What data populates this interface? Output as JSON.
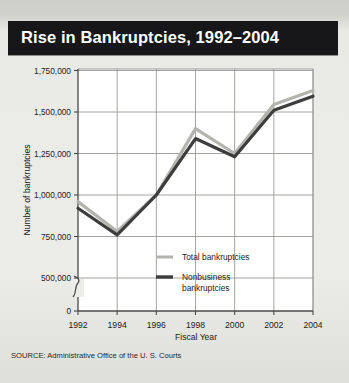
{
  "title": "Rise in Bankruptcies, 1992–2004",
  "source": "SOURCE: Administrative Office of the U. S. Courts",
  "colors": {
    "title_bar": "#17171a",
    "title_text": "#ffffff",
    "page_background": "#ececE8",
    "plot_background": "#ffffff",
    "grid": "#9a9a96",
    "axis": "#4a4a48",
    "total_series": "#b3b3b0",
    "nonbusiness_series": "#3d3d3d",
    "text": "#1c1c1c"
  },
  "chart_data": {
    "type": "line",
    "title": "Rise in Bankruptcies, 1992–2004",
    "xlabel": "Fiscal Year",
    "ylabel": "Number of bankruptcies",
    "x": [
      1992,
      1994,
      1996,
      1998,
      2000,
      2002,
      2004
    ],
    "xtick_labels": [
      "1992",
      "1994",
      "1996",
      "1998",
      "2000",
      "2002",
      "2004"
    ],
    "ytick_labels": [
      "0",
      "500,000",
      "750,000",
      "1,000,000",
      "1,250,000",
      "1,500,000",
      "1,750,000"
    ],
    "ytick_values": [
      0,
      500000,
      750000,
      1000000,
      1250000,
      1500000,
      1750000
    ],
    "ylim": [
      500000,
      1750000
    ],
    "xlim": [
      1992,
      2004
    ],
    "axis_break": true,
    "axis_break_between": [
      0,
      500000
    ],
    "grid": true,
    "legend_position": "inside-center-lower",
    "series": [
      {
        "name": "Total bankruptcies",
        "color": "#b3b3b0",
        "values": [
          960000,
          780000,
          1000000,
          1400000,
          1250000,
          1545000,
          1630000
        ]
      },
      {
        "name": "Nonbusiness bankruptcies",
        "color": "#3d3d3d",
        "values": [
          920000,
          760000,
          1000000,
          1340000,
          1230000,
          1510000,
          1595000
        ]
      }
    ],
    "legend": [
      {
        "label": "Total bankruptcies",
        "color": "#b3b3b0"
      },
      {
        "label": "Nonbusiness bankruptcies",
        "color": "#3d3d3d"
      }
    ]
  }
}
